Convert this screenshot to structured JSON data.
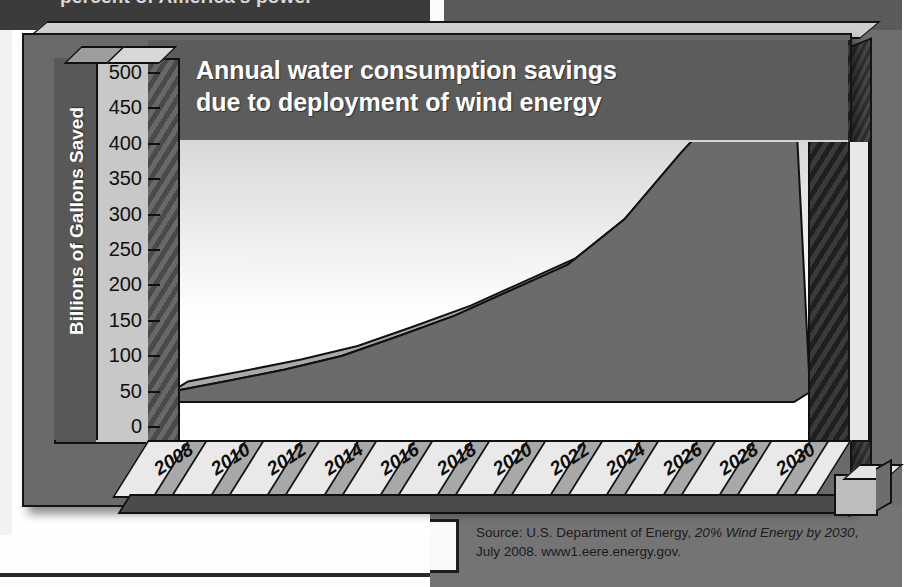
{
  "page": {
    "clipped_headline": "percent of America's power",
    "source_prefix": "Source: U.S. Department of Energy, ",
    "source_italic_1": "20% Wind Energy",
    "source_mid": "",
    "source_italic_2": "by 2030",
    "source_suffix": ", July 2008. www1.eere.energy.gov."
  },
  "chart_data": {
    "type": "area",
    "title": "Annual water consumption savings\ndue to deployment of wind energy",
    "title_line_1": "Annual water consumption savings",
    "title_line_2": "due to deployment of wind energy",
    "xlabel": "",
    "ylabel": "Billions of Gallons Saved",
    "ylim": [
      0,
      500
    ],
    "ytick_step": 50,
    "yticks": [
      0,
      50,
      100,
      150,
      200,
      250,
      300,
      350,
      400,
      450,
      500
    ],
    "ytick_labels": [
      "0",
      "50",
      "100",
      "150",
      "200",
      "250",
      "300",
      "350",
      "400",
      "450",
      "500"
    ],
    "categories": [
      2008,
      2010,
      2012,
      2014,
      2016,
      2018,
      2020,
      2022,
      2024,
      2026,
      2028,
      2030
    ],
    "category_labels": [
      "2008",
      "2010",
      "2012",
      "2014",
      "2016",
      "2018",
      "2020",
      "2022",
      "2024",
      "2026",
      "2028",
      "2030"
    ],
    "values": [
      15,
      30,
      46,
      65,
      93,
      122,
      158,
      194,
      258,
      352,
      438,
      464
    ],
    "series": [
      {
        "name": "Annual water consumption savings",
        "values": [
          15,
          30,
          46,
          65,
          93,
          122,
          158,
          194,
          258,
          352,
          438,
          464
        ]
      }
    ],
    "grid": false,
    "legend": "none",
    "style": "3d-area",
    "colors": {
      "area_fill": "#6b6b6b",
      "area_top": "#a9a9a9",
      "plot_background": "#f2f2f2",
      "title_band": "#5c5c5c",
      "axis_band": "#585858",
      "frame": "#6a6a6a",
      "outline": "#101010"
    }
  }
}
